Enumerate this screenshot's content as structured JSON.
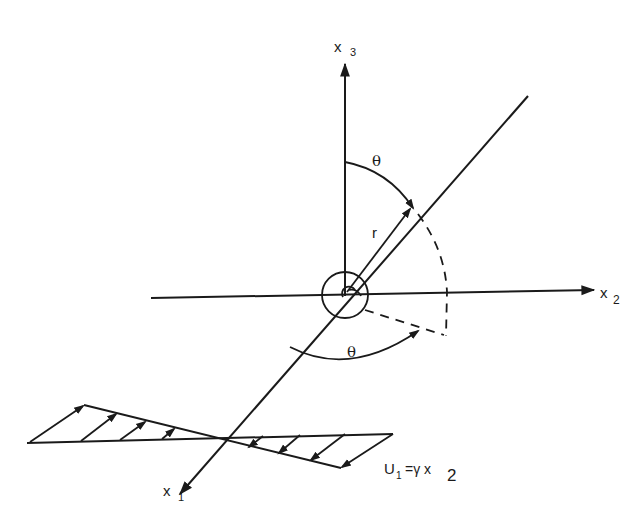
{
  "figure": {
    "type": "coordinate-system diagram with simple shear flow",
    "axes": {
      "x1": {
        "label": "x",
        "subscript": "1"
      },
      "x2": {
        "label": "x",
        "subscript": "2"
      },
      "x3": {
        "label": "x",
        "subscript": "3"
      }
    },
    "symbols": {
      "theta_upper": "θ",
      "theta_lower": "θ",
      "radius": "r"
    },
    "flow_equation": {
      "lhs": "U",
      "lhs_subscript": "1",
      "rhs": "=γ x",
      "rhs_subscript": "2"
    },
    "colors": {
      "ink": "#1a1a1a",
      "background": "#ffffff"
    }
  }
}
